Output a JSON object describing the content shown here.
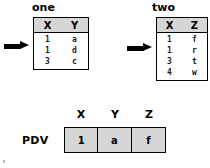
{
  "diagram": {
    "title_one": "one",
    "title_two": "two",
    "pdv_label": "PDV",
    "arrow_one_name": "read-pointer-one",
    "arrow_two_name": "read-pointer-two"
  },
  "table_one": {
    "name": "one",
    "columns": [
      "X",
      "Y"
    ],
    "rows": [
      [
        "1",
        "a"
      ],
      [
        "1",
        "d"
      ],
      [
        "3",
        "c"
      ]
    ]
  },
  "table_two": {
    "name": "two",
    "columns": [
      "X",
      "Z"
    ],
    "rows": [
      [
        "1",
        "f"
      ],
      [
        "1",
        "r"
      ],
      [
        "3",
        "t"
      ],
      [
        "4",
        "w"
      ]
    ]
  },
  "pdv": {
    "columns": [
      "X",
      "Y",
      "Z"
    ],
    "values": [
      "1",
      "a",
      "f"
    ]
  },
  "colors": {
    "header_fill": "#d6d6d6",
    "border": "#000000",
    "text": "#000000",
    "background": "#ffffff"
  }
}
